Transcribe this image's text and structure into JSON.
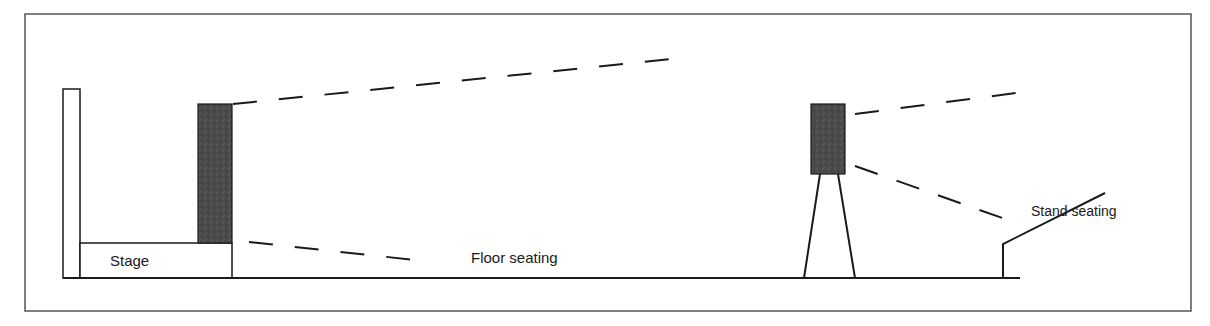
{
  "diagram": {
    "type": "venue-speaker-layout",
    "labels": {
      "stage": "Stage",
      "floor_seating": "Floor seating",
      "stand_seating": "Stand seating"
    },
    "elements": {
      "main_speaker": "Stage-side speaker stack",
      "delay_speaker": "Delay speaker tower"
    },
    "colors": {
      "line": "#1a1a1a",
      "speaker_fill": "#4a4a4a",
      "frame": "#555555"
    }
  }
}
